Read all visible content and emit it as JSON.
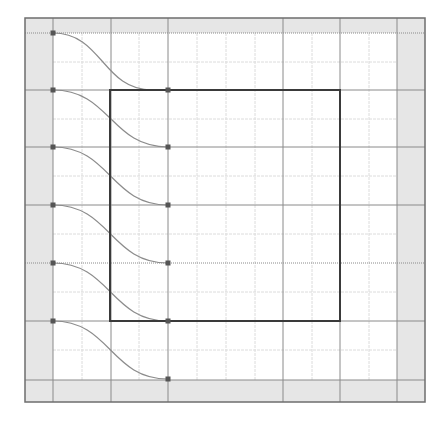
{
  "diagram": {
    "title": "",
    "canvas": {
      "width": 444,
      "height": 428
    },
    "outer_frame": {
      "x": 25,
      "y": 18,
      "w": 400,
      "h": 384
    },
    "margin_bands": {
      "left_x": 53,
      "right_x": 397,
      "top_y": 33,
      "bottom_y": 380
    },
    "major_x": [
      53,
      111,
      168,
      283,
      340,
      397
    ],
    "major_y": [
      33,
      90,
      147,
      205,
      263,
      321,
      380
    ],
    "minor_x": [
      82,
      139,
      197,
      226,
      255,
      312,
      369
    ],
    "minor_y": [
      62,
      119,
      176,
      234,
      292,
      350
    ],
    "box": {
      "x": 110,
      "y": 90,
      "w": 230,
      "h": 231
    },
    "connectors": [
      {
        "from": [
          53,
          33
        ],
        "to": [
          152,
          90
        ]
      },
      {
        "from": [
          53,
          90
        ],
        "to": [
          168,
          147
        ]
      },
      {
        "from": [
          53,
          147
        ],
        "to": [
          168,
          205
        ]
      },
      {
        "from": [
          53,
          205
        ],
        "to": [
          168,
          263
        ]
      },
      {
        "from": [
          53,
          263
        ],
        "to": [
          168,
          321
        ]
      },
      {
        "from": [
          53,
          321
        ],
        "to": [
          168,
          379
        ]
      }
    ],
    "nodes": [
      [
        53,
        33
      ],
      [
        53,
        90
      ],
      [
        53,
        147
      ],
      [
        53,
        205
      ],
      [
        53,
        263
      ],
      [
        53,
        321
      ],
      [
        168,
        90
      ],
      [
        168,
        147
      ],
      [
        168,
        205
      ],
      [
        168,
        263
      ],
      [
        168,
        321
      ],
      [
        168,
        379
      ]
    ],
    "colors": {
      "band": "#e6e6e6",
      "frame": "#6e6e6e",
      "major_line": "#8a8a8a",
      "minor_line": "#dcdcdc",
      "box": "#3a3a3a",
      "curve": "#8c8c8c",
      "node": "#555555"
    }
  }
}
